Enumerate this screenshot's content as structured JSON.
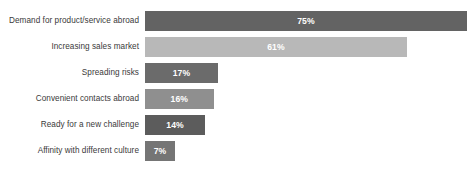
{
  "chart_data": {
    "type": "bar",
    "orientation": "horizontal",
    "title": "",
    "xlabel": "",
    "ylabel": "",
    "xlim": [
      0,
      75
    ],
    "grid": false,
    "legend": null,
    "value_suffix": "%",
    "categories": [
      "Demand for product/service abroad",
      "Increasing sales market",
      "Spreading risks",
      "Convenient contacts abroad",
      "Ready for a new challenge",
      "Affinity with different culture"
    ],
    "values": [
      75,
      61,
      17,
      16,
      14,
      7
    ],
    "value_labels": [
      "75%",
      "61%",
      "17%",
      "16%",
      "14%",
      "7%"
    ],
    "bar_colors": [
      "#636363",
      "#b8b8b8",
      "#6b6b6b",
      "#8f8f8f",
      "#5c5c5c",
      "#757575"
    ],
    "bars": [
      {
        "label": "Demand for product/service abroad",
        "value": 75,
        "value_label": "75%",
        "color": "#636363"
      },
      {
        "label": "Increasing sales market",
        "value": 61,
        "value_label": "61%",
        "color": "#b8b8b8"
      },
      {
        "label": "Spreading risks",
        "value": 17,
        "value_label": "17%",
        "color": "#6b6b6b"
      },
      {
        "label": "Convenient contacts abroad",
        "value": 16,
        "value_label": "16%",
        "color": "#8f8f8f"
      },
      {
        "label": "Ready for a new challenge",
        "value": 14,
        "value_label": "14%",
        "color": "#5c5c5c"
      },
      {
        "label": "Affinity with different culture",
        "value": 7,
        "value_label": "7%",
        "color": "#757575"
      }
    ]
  },
  "colors": {
    "background": "#ffffff",
    "label_text": "#3a3a3a",
    "value_text": "#ffffff",
    "dark_bar": "#636363",
    "light_bar": "#b8b8b8"
  }
}
